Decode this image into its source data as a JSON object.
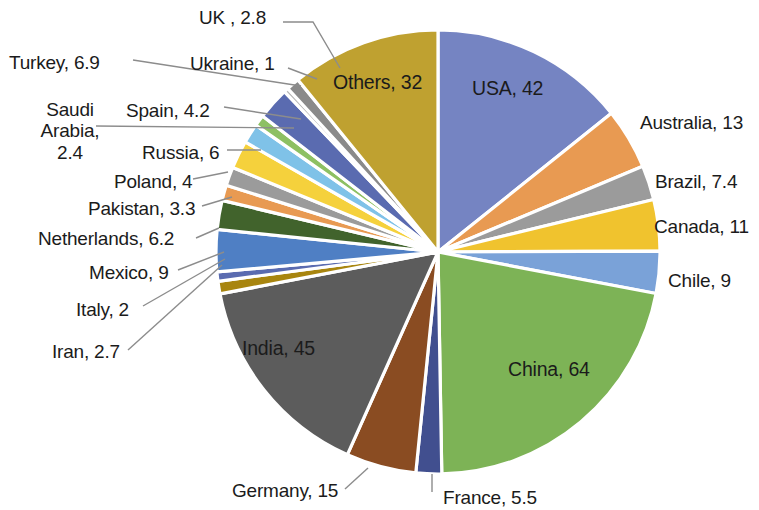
{
  "chart_data": {
    "type": "pie",
    "title": "",
    "subtitle": "",
    "legend_position": "none",
    "label_format": "name, value",
    "start_angle_deg": 0,
    "direction": "clockwise",
    "total": 297.4,
    "categories": [
      "USA",
      "Australia",
      "Brazil",
      "Canada",
      "Chile",
      "China",
      "France",
      "Germany",
      "India",
      "Iran",
      "Italy",
      "Mexico",
      "Netherlands",
      "Pakistan",
      "Poland",
      "Russia",
      "Spain",
      "Saudi Arabia",
      "Turkey",
      "Ukraine",
      "UK",
      "Others"
    ],
    "values": [
      42,
      13,
      7.4,
      11,
      9,
      64,
      5.5,
      15,
      45,
      2.7,
      2,
      9,
      6.2,
      3.3,
      4,
      6,
      4.2,
      2.4,
      6.9,
      1,
      2.8,
      32
    ],
    "colors": [
      "#7584c2",
      "#e89a52",
      "#9b9b9b",
      "#f0c32e",
      "#7aa2d8",
      "#7db356",
      "#414f8f",
      "#8a4c22",
      "#5c5c5c",
      "#a8850f",
      "#5a6bb0",
      "#4f7fc4",
      "#41632c",
      "#e89a52",
      "#9b9b9b",
      "#f5d13c",
      "#7fc2e8",
      "#8dc063",
      "#5a6bb0",
      "#b8b8b8",
      "#8a8a8a",
      "#bfa130"
    ],
    "slices": [
      {
        "name": "USA",
        "value": 42,
        "label": "USA, 42",
        "color": "#7584c2",
        "label_inside": true
      },
      {
        "name": "Australia",
        "value": 13,
        "label": "Australia, 13",
        "color": "#e89a52",
        "label_inside": false
      },
      {
        "name": "Brazil",
        "value": 7.4,
        "label": "Brazil, 7.4",
        "color": "#9b9b9b",
        "label_inside": false
      },
      {
        "name": "Canada",
        "value": 11,
        "label": "Canada, 11",
        "color": "#f0c32e",
        "label_inside": false
      },
      {
        "name": "Chile",
        "value": 9,
        "label": "Chile, 9",
        "color": "#7aa2d8",
        "label_inside": false
      },
      {
        "name": "China",
        "value": 64,
        "label": "China, 64",
        "color": "#7db356",
        "label_inside": true
      },
      {
        "name": "France",
        "value": 5.5,
        "label": "France, 5.5",
        "color": "#414f8f",
        "label_inside": false
      },
      {
        "name": "Germany",
        "value": 15,
        "label": "Germany, 15",
        "color": "#8a4c22",
        "label_inside": false
      },
      {
        "name": "India",
        "value": 45,
        "label": "India, 45",
        "color": "#5c5c5c",
        "label_inside": true
      },
      {
        "name": "Iran",
        "value": 2.7,
        "label": "Iran, 2.7",
        "color": "#a8850f",
        "label_inside": false
      },
      {
        "name": "Italy",
        "value": 2,
        "label": "Italy, 2",
        "color": "#5a6bb0",
        "label_inside": false
      },
      {
        "name": "Mexico",
        "value": 9,
        "label": "Mexico, 9",
        "color": "#4f7fc4",
        "label_inside": false
      },
      {
        "name": "Netherlands",
        "value": 6.2,
        "label": "Netherlands, 6.2",
        "color": "#41632c",
        "label_inside": false
      },
      {
        "name": "Pakistan",
        "value": 3.3,
        "label": "Pakistan, 3.3",
        "color": "#e89a52",
        "label_inside": false
      },
      {
        "name": "Poland",
        "value": 4,
        "label": "Poland, 4",
        "color": "#9b9b9b",
        "label_inside": false
      },
      {
        "name": "Russia",
        "value": 6,
        "label": "Russia, 6",
        "color": "#f5d13c",
        "label_inside": false
      },
      {
        "name": "Spain",
        "value": 4.2,
        "label": "Spain, 4.2",
        "color": "#7fc2e8",
        "label_inside": false
      },
      {
        "name": "Saudi Arabia",
        "value": 2.4,
        "label": "Saudi\nArabia,\n2.4",
        "color": "#8dc063",
        "label_inside": false
      },
      {
        "name": "Turkey",
        "value": 6.9,
        "label": "Turkey, 6.9",
        "color": "#5a6bb0",
        "label_inside": false
      },
      {
        "name": "Ukraine",
        "value": 1,
        "label": "Ukraine, 1",
        "color": "#b8b8b8",
        "label_inside": false
      },
      {
        "name": "UK",
        "value": 2.8,
        "label": "UK , 2.8",
        "color": "#8a8a8a",
        "label_inside": false
      },
      {
        "name": "Others",
        "value": 32,
        "label": "Others, 32",
        "color": "#bfa130",
        "label_inside": true
      }
    ]
  },
  "geometry": {
    "cx": 438,
    "cy": 252,
    "r": 222,
    "labels": [
      {
        "name": "USA",
        "x": 472,
        "y": 78,
        "align": "left"
      },
      {
        "name": "Others",
        "x": 333,
        "y": 72,
        "align": "left"
      },
      {
        "name": "Australia",
        "x": 640,
        "y": 112,
        "align": "left"
      },
      {
        "name": "Brazil",
        "x": 655,
        "y": 171,
        "align": "left"
      },
      {
        "name": "Canada",
        "x": 654,
        "y": 216,
        "align": "left"
      },
      {
        "name": "Chile",
        "x": 668,
        "y": 270,
        "align": "left"
      },
      {
        "name": "China",
        "x": 508,
        "y": 359,
        "align": "left"
      },
      {
        "name": "France",
        "x": 443,
        "y": 487,
        "align": "left"
      },
      {
        "name": "Germany",
        "x": 232,
        "y": 480,
        "align": "left"
      },
      {
        "name": "India",
        "x": 242,
        "y": 338,
        "align": "left"
      },
      {
        "name": "Iran",
        "x": 52,
        "y": 341,
        "align": "left"
      },
      {
        "name": "Italy",
        "x": 76,
        "y": 299,
        "align": "left"
      },
      {
        "name": "Mexico",
        "x": 89,
        "y": 262,
        "align": "left"
      },
      {
        "name": "Netherlands",
        "x": 38,
        "y": 228,
        "align": "left"
      },
      {
        "name": "Pakistan",
        "x": 88,
        "y": 198,
        "align": "left"
      },
      {
        "name": "Poland",
        "x": 114,
        "y": 171,
        "align": "left"
      },
      {
        "name": "Russia",
        "x": 142,
        "y": 142,
        "align": "left"
      },
      {
        "name": "Spain",
        "x": 126,
        "y": 100,
        "align": "left"
      },
      {
        "name": "Saudi Arabia",
        "x": 10,
        "y": 99,
        "align": "center"
      },
      {
        "name": "Turkey",
        "x": 9,
        "y": 52,
        "align": "left"
      },
      {
        "name": "Ukraine",
        "x": 190,
        "y": 53,
        "align": "left"
      },
      {
        "name": "UK",
        "x": 199,
        "y": 7,
        "align": "left"
      }
    ],
    "leaders": [
      {
        "name": "UK",
        "points": "283,22 313,22 340,68"
      },
      {
        "name": "Ukraine",
        "points": "288,68 317,79"
      },
      {
        "name": "Turkey",
        "points": "133,60 301,86"
      },
      {
        "name": "Spain",
        "points": "224,107 301,119"
      },
      {
        "name": "Saudi Arabia",
        "points": "96,126 294,128"
      },
      {
        "name": "Russia",
        "points": "227,150 261,150"
      },
      {
        "name": "Poland",
        "points": "193,179 228,172"
      },
      {
        "name": "Pakistan",
        "points": "202,206 232,197"
      },
      {
        "name": "Netherlands",
        "points": "196,238 219,228"
      },
      {
        "name": "Mexico",
        "points": "178,270 224,252"
      },
      {
        "name": "Italy",
        "points": "143,306 225,259"
      },
      {
        "name": "Iran",
        "points": "128,350 222,265"
      },
      {
        "name": "Germany",
        "points": "345,489 368,468"
      },
      {
        "name": "France",
        "points": "432,474 432,492"
      }
    ]
  }
}
